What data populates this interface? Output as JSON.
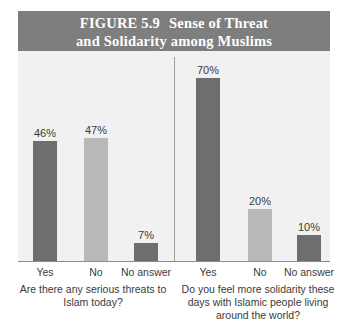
{
  "figure": {
    "title_line_1_number": "FIGURE 5.9",
    "title_line_1_text": "Sense of Threat",
    "title_line_2": "and Solidarity among Muslims",
    "banner_color": "#7e7e7e",
    "plot_background": "#f1f1f1",
    "dark_bar_color": "#6e6e6e",
    "light_bar_color": "#b9b9b9"
  },
  "chart_data": {
    "type": "bar",
    "xlabel": "",
    "ylabel": "",
    "ylim": [
      0,
      80
    ],
    "grid": false,
    "legend": "none",
    "value_suffix": "%",
    "groups": [
      {
        "caption": "Are there any serious threats to Islam today?",
        "categories": [
          "Yes",
          "No",
          "No answer"
        ],
        "values": [
          46,
          47,
          7
        ],
        "labels": [
          "46%",
          "47%",
          "7%"
        ],
        "colors": [
          "#6e6e6e",
          "#b9b9b9",
          "#6e6e6e"
        ]
      },
      {
        "caption": "Do you feel more solidarity these days with Islamic people living around the world?",
        "categories": [
          "Yes",
          "No",
          "No answer"
        ],
        "values": [
          70,
          20,
          10
        ],
        "labels": [
          "70%",
          "20%",
          "10%"
        ],
        "colors": [
          "#6e6e6e",
          "#b9b9b9",
          "#6e6e6e"
        ]
      }
    ]
  },
  "captions": {
    "left": "Are there any serious threats to Islam today?",
    "right": "Do you feel more solidarity these days with Islamic people living around the world?"
  }
}
